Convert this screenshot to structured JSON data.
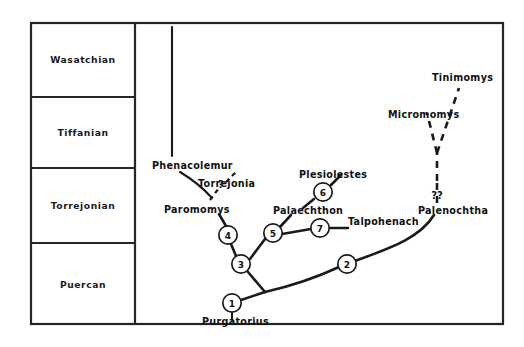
{
  "figure": {
    "type": "phylogenetic-cladogram",
    "background_color": "#ffffff",
    "line_color": "#1a1a1a"
  },
  "time_scale": {
    "title": "North American Land Mammal Ages",
    "orientation": "youngest-at-top",
    "epochs": [
      {
        "id": "wasatchian",
        "label": "Wasatchian"
      },
      {
        "id": "tiffanian",
        "label": "Tiffanian"
      },
      {
        "id": "torrejonian",
        "label": "Torrejonian"
      },
      {
        "id": "puercan",
        "label": "Puercan"
      }
    ]
  },
  "tree": {
    "taxa": [
      {
        "id": "phenacolemur",
        "label": "Phenacolemur"
      },
      {
        "id": "torrejonia",
        "label": "Torrejonia"
      },
      {
        "id": "paromomys",
        "label": "Paromomys"
      },
      {
        "id": "plesiolestes",
        "label": "Plesiolestes"
      },
      {
        "id": "palaechthon",
        "label": "Palaechthon"
      },
      {
        "id": "talpohenach",
        "label": "Talpohenach"
      },
      {
        "id": "palenochtha",
        "label": "Palenochtha"
      },
      {
        "id": "micromomys",
        "label": "Micromomys"
      },
      {
        "id": "tinimomys",
        "label": "Tinimomys"
      },
      {
        "id": "purgatorius",
        "label": "Purgatorius"
      }
    ],
    "nodes": [
      {
        "id": "node-1",
        "label": "1"
      },
      {
        "id": "node-2",
        "label": "2"
      },
      {
        "id": "node-3",
        "label": "3"
      },
      {
        "id": "node-4",
        "label": "4"
      },
      {
        "id": "node-5",
        "label": "5"
      },
      {
        "id": "node-6",
        "label": "6"
      },
      {
        "id": "node-7",
        "label": "7"
      }
    ],
    "uncertainty_marks": [
      {
        "id": "torrejonia-query",
        "label": "?"
      },
      {
        "id": "palenochtha-query",
        "label": "??"
      }
    ]
  }
}
